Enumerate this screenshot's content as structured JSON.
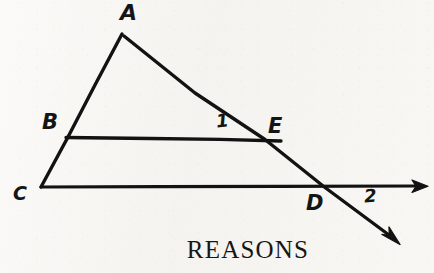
{
  "figure": {
    "caption": "REASONS",
    "ink_color": "#121212",
    "paper_color": "#f7f6f3",
    "stroke_width": 3.2,
    "points": {
      "A": {
        "x": 122,
        "y": 34
      },
      "B": {
        "x": 68,
        "y": 137
      },
      "C": {
        "x": 41,
        "y": 187
      },
      "D": {
        "x": 325,
        "y": 187
      },
      "E": {
        "x": 265,
        "y": 139
      },
      "ray_right_end": {
        "x": 427,
        "y": 186
      },
      "ray_diagonal_end": {
        "x": 399,
        "y": 243
      }
    },
    "labels": {
      "A": "A",
      "B": "B",
      "C": "C",
      "D": "D",
      "E": "E",
      "angle_1": "1",
      "angle_2": "2"
    },
    "segments": [
      {
        "name": "segment-A-to-C",
        "from": "A",
        "to": "C"
      },
      {
        "name": "segment-B-to-E",
        "from": "B",
        "to": "E"
      },
      {
        "name": "ray-C-through-D",
        "from": "C",
        "to": "ray_right_end",
        "arrow": true
      },
      {
        "name": "ray-A-through-E-and-D",
        "from": "A",
        "to": "ray_diagonal_end",
        "arrow": true
      }
    ]
  }
}
